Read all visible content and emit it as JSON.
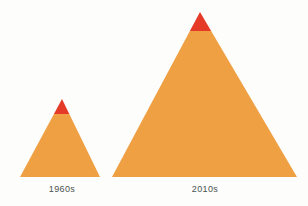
{
  "figure": {
    "background_color": "#fdfdfc",
    "label_color": "#4a5350"
  },
  "chart_data": {
    "type": "bar",
    "title": "",
    "subtitle": "",
    "xlabel": "",
    "ylabel": "",
    "grid": false,
    "legend": "none",
    "categories": [
      "1960s",
      "2010s"
    ],
    "values": [
      78,
      165
    ],
    "value_units": "pyramid height in pixels",
    "series": [
      {
        "name": "Orange body",
        "color": "#efa043",
        "values": [
          63,
          146
        ]
      },
      {
        "name": "Red tip",
        "color": "#e63a28",
        "values": [
          15,
          19
        ]
      }
    ],
    "shapes": [
      {
        "id": "pyramid-1960s",
        "category": "1960s",
        "apex_x": 62,
        "apex_y": 99,
        "base_y": 177,
        "base_left_x": 20,
        "base_right_x": 100,
        "height": 78,
        "base_width": 80,
        "tip_split_y": 114,
        "tip_fraction": 0.19,
        "body_color": "#efa043",
        "tip_color": "#e63a28"
      },
      {
        "id": "pyramid-2010s",
        "category": "2010s",
        "apex_x": 200,
        "apex_y": 12,
        "base_y": 177,
        "base_left_x": 112,
        "base_right_x": 297,
        "height": 165,
        "base_width": 185,
        "tip_split_y": 31,
        "tip_fraction": 0.115,
        "body_color": "#efa043",
        "tip_color": "#e63a28"
      }
    ]
  },
  "labels": {
    "small": "1960s",
    "large": "2010s"
  }
}
